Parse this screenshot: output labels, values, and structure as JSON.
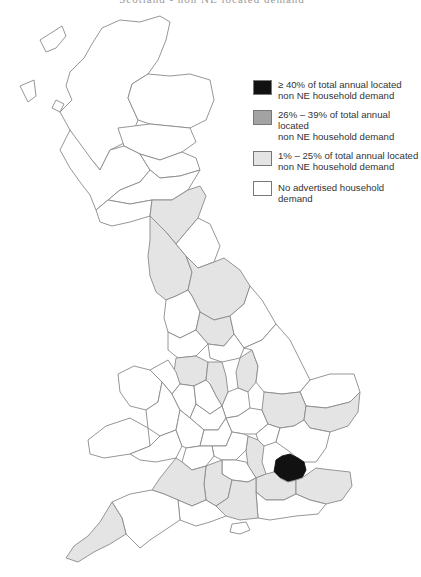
{
  "title_partial": "Scotland - non NE located demand",
  "legend": {
    "items": [
      {
        "key": "high",
        "label_line1": "≥ 40% of total annual located",
        "label_line2": "non NE household demand",
        "color": "#111111"
      },
      {
        "key": "mid",
        "label_line1": "26% – 39% of total annual located",
        "label_line2": "non NE household demand",
        "color": "#a3a3a3"
      },
      {
        "key": "low",
        "label_line1": "1% – 25% of total annual located",
        "label_line2": "non NE household demand",
        "color": "#e4e4e4"
      },
      {
        "key": "none",
        "label_line1": "No advertised household demand",
        "label_line2": "",
        "color": "#ffffff"
      }
    ]
  },
  "map": {
    "outline_color": "#8a8a8a",
    "regions": [
      {
        "name": "London",
        "category": "high"
      },
      {
        "name": "Northumberland",
        "category": "low"
      },
      {
        "name": "Cumbria",
        "category": "low"
      },
      {
        "name": "North Yorkshire",
        "category": "low"
      },
      {
        "name": "West Yorkshire",
        "category": "low"
      },
      {
        "name": "Cheshire",
        "category": "low"
      },
      {
        "name": "Derbyshire",
        "category": "low"
      },
      {
        "name": "Nottinghamshire",
        "category": "low"
      },
      {
        "name": "Cambridgeshire",
        "category": "low"
      },
      {
        "name": "Suffolk",
        "category": "low"
      },
      {
        "name": "Hertfordshire",
        "category": "low"
      },
      {
        "name": "Surrey",
        "category": "low"
      },
      {
        "name": "Kent",
        "category": "low"
      },
      {
        "name": "Somerset",
        "category": "low"
      },
      {
        "name": "Wiltshire",
        "category": "low"
      },
      {
        "name": "Hampshire",
        "category": "low"
      },
      {
        "name": "Cornwall",
        "category": "low"
      }
    ]
  }
}
